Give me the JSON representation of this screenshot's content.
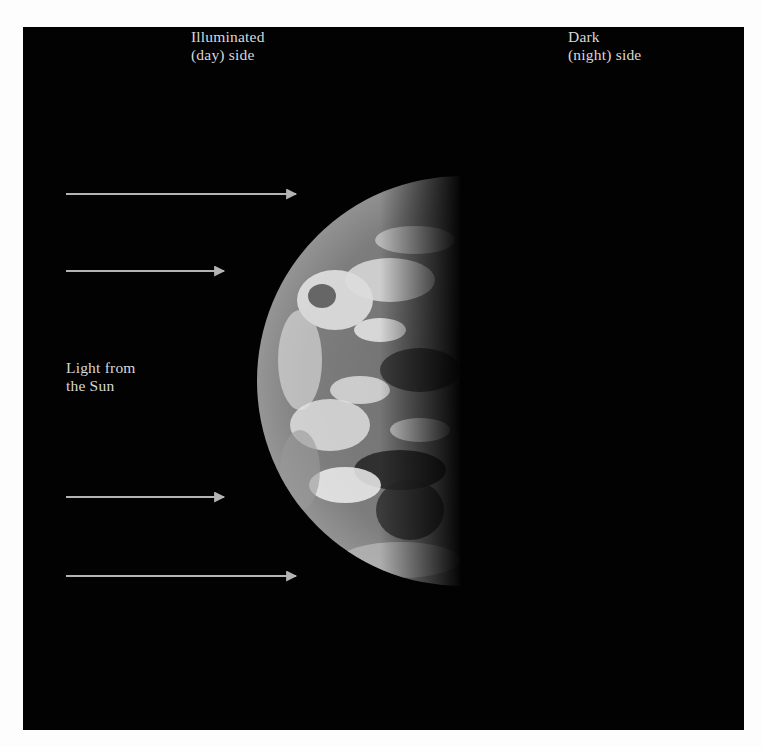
{
  "figure": {
    "labels": {
      "day_side": "Illuminated\n(day) side",
      "night_side": "Dark\n(night) side",
      "sunlight": "Light from\nthe Sun"
    },
    "arrows": [
      {
        "name": "sunlight-arrow-1",
        "y": 194,
        "x1": 66,
        "x2": 296
      },
      {
        "name": "sunlight-arrow-2",
        "y": 271,
        "x1": 66,
        "x2": 224
      },
      {
        "name": "sunlight-arrow-3",
        "y": 497,
        "x1": 66,
        "x2": 224
      },
      {
        "name": "sunlight-arrow-4",
        "y": 576,
        "x1": 66,
        "x2": 296
      }
    ],
    "colors": {
      "background": "#020202",
      "frame": "#fdfdfd",
      "arrow": "#b4b4b4",
      "text": "#d8d8d8"
    }
  }
}
